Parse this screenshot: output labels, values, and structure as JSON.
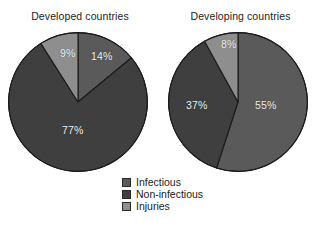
{
  "figure": {
    "background": "#ffffff",
    "label_color": "#f2f2f2",
    "text_color": "#1c1c1c"
  },
  "colors": {
    "infectious": "#5a5a5a",
    "non_infectious": "#3f3f3f",
    "injuries": "#8e8e8e",
    "slice_edge": "#1a1a1a"
  },
  "legend": {
    "items": [
      {
        "label": "Infectious",
        "color": "#5a5a5a"
      },
      {
        "label": "Non-infectious",
        "color": "#3f3f3f"
      },
      {
        "label": "Injuries",
        "color": "#8e8e8e"
      }
    ]
  },
  "charts": {
    "left": {
      "title": "Developed countries",
      "labels": {
        "infectious": "14%",
        "non_infectious": "77%",
        "injuries": "9%"
      }
    },
    "right": {
      "title": "Developing countries",
      "labels": {
        "infectious": "55%",
        "non_infectious": "37%",
        "injuries": "8%"
      }
    }
  },
  "chart_data": [
    {
      "type": "pie",
      "title": "Developed countries",
      "categories": [
        "Infectious",
        "Non-infectious",
        "Injuries"
      ],
      "values": [
        14,
        77,
        9
      ],
      "labels": [
        "14%",
        "77%",
        "9%"
      ],
      "colors": [
        "#5a5a5a",
        "#3f3f3f",
        "#8e8e8e"
      ],
      "start_angle_deg": 0,
      "direction": "clockwise",
      "units": "percent",
      "legend_position": "bottom-center",
      "grid": false
    },
    {
      "type": "pie",
      "title": "Developing countries",
      "categories": [
        "Infectious",
        "Non-infectious",
        "Injuries"
      ],
      "values": [
        55,
        37,
        8
      ],
      "labels": [
        "55%",
        "37%",
        "8%"
      ],
      "colors": [
        "#5a5a5a",
        "#3f3f3f",
        "#8e8e8e"
      ],
      "start_angle_deg": 0,
      "direction": "clockwise",
      "units": "percent",
      "legend_position": "bottom-center",
      "grid": false
    }
  ]
}
